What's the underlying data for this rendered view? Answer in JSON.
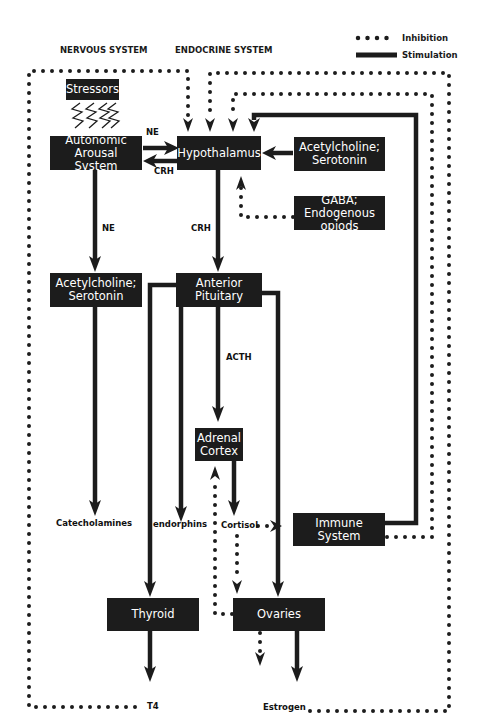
{
  "headers": {
    "nervous": "NERVOUS SYSTEM",
    "endocrine": "ENDOCRINE SYSTEM"
  },
  "legend": {
    "inhibition": "Inhibition",
    "stimulation": "Stimulation"
  },
  "nodes": {
    "stressors": "Stressors",
    "autonomic": "Autonomic Arousal System",
    "hypothalamus": "Hypothalamus",
    "ach_sero_right": "Acetylcholine; Serotonin",
    "gaba": "GABA; Endogenous opiods",
    "ach_sero_left": "Acetylcholine; Serotonin",
    "anterior_pituitary": "Anterior Pituitary",
    "adrenal_cortex": "Adrenal Cortex",
    "immune_system": "Immune System",
    "thyroid": "Thyroid",
    "ovaries": "Ovaries"
  },
  "edge_labels": {
    "ne_top": "NE",
    "crh_left": "CRH",
    "ne_down": "NE",
    "crh_down": "CRH",
    "acth": "ACTH",
    "catecholamines": "Catecholamines",
    "endorphins": "endorphins",
    "cortisol": "Cortisol",
    "t4": "T4",
    "estrogen": "Estrogen"
  },
  "colors": {
    "ink": "#1c1c1c",
    "background": "#ffffff"
  }
}
